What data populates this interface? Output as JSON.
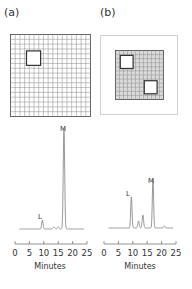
{
  "panels": [
    {
      "label": "(a)",
      "chromatogram": {
        "peaks": [
          {
            "name": "L",
            "time_min": 9.5,
            "relative_height": 0.09
          },
          {
            "name": "M",
            "time_min": 17.0,
            "relative_height": 1.0
          }
        ],
        "minor_peaks": [
          {
            "time_min": 13.5,
            "relative_height": 0.02
          },
          {
            "time_min": 15.0,
            "relative_height": 0.02
          }
        ]
      }
    },
    {
      "label": "(b)",
      "chromatogram": {
        "peaks": [
          {
            "name": "L",
            "time_min": 9.5,
            "relative_height": 0.31
          },
          {
            "name": "M",
            "time_min": 17.0,
            "relative_height": 0.48
          }
        ],
        "minor_peaks": [
          {
            "time_min": 12.0,
            "relative_height": 0.07
          },
          {
            "time_min": 13.5,
            "relative_height": 0.13
          },
          {
            "time_min": 21.0,
            "relative_height": 0.02
          }
        ]
      }
    }
  ],
  "axis": {
    "ticks": [
      "0",
      "5",
      "10",
      "15",
      "20",
      "25"
    ],
    "tick_values": [
      0,
      5,
      10,
      15,
      20,
      25
    ],
    "xlabel": "Minutes",
    "xlim": [
      0,
      25
    ]
  },
  "colors": {
    "line": "#8c8c8c",
    "grid": "#9a9a9a",
    "grid_fill_b": "#d9d9d9",
    "text": "#333333"
  }
}
